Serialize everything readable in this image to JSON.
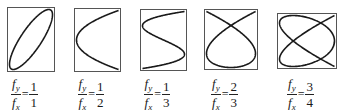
{
  "figure": {
    "stroke_color": "#1a1a1a",
    "frame_color": "#555555",
    "panels": [
      {
        "id": "ratio-1-1",
        "fy_label": "f",
        "fy_sub": "y",
        "fx_label": "f",
        "fx_sub": "x",
        "equals": "=",
        "numerator": "1",
        "denominator": "1",
        "box": {
          "x": 7,
          "y": 7,
          "w": 48,
          "h": 65
        },
        "a": 1,
        "b": 1,
        "phase": 0.6
      },
      {
        "id": "ratio-1-2",
        "fy_label": "f",
        "fy_sub": "y",
        "fx_label": "f",
        "fx_sub": "x",
        "equals": "=",
        "numerator": "1",
        "denominator": "2",
        "box": {
          "x": 74,
          "y": 8,
          "w": 47,
          "h": 64
        },
        "a": 1,
        "b": 2,
        "phase": 0.0
      },
      {
        "id": "ratio-1-3",
        "fy_label": "f",
        "fy_sub": "y",
        "fx_label": "f",
        "fx_sub": "x",
        "equals": "=",
        "numerator": "1",
        "denominator": "3",
        "box": {
          "x": 140,
          "y": 9,
          "w": 47,
          "h": 62
        },
        "a": 1,
        "b": 3,
        "phase": 0.0
      },
      {
        "id": "ratio-2-3",
        "fy_label": "f",
        "fy_sub": "y",
        "fx_label": "f",
        "fx_sub": "x",
        "equals": "=",
        "numerator": "2",
        "denominator": "3",
        "box": {
          "x": 204,
          "y": 9,
          "w": 54,
          "h": 61
        },
        "a": 2,
        "b": 3,
        "phase": 0.0
      },
      {
        "id": "ratio-3-4",
        "fy_label": "f",
        "fy_sub": "y",
        "fx_label": "f",
        "fx_sub": "x",
        "equals": "=",
        "numerator": "3",
        "denominator": "4",
        "box": {
          "x": 277,
          "y": 13,
          "w": 60,
          "h": 56
        },
        "a": 3,
        "b": 4,
        "phase": 0.0
      }
    ]
  }
}
